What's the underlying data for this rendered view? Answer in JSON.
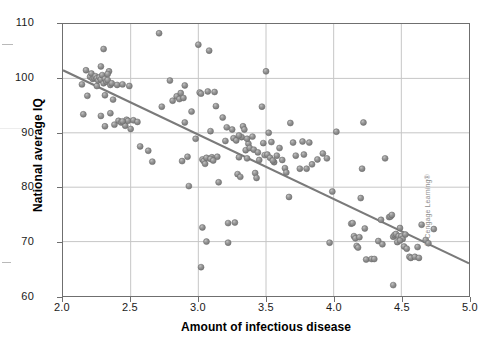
{
  "figure": {
    "credit": "© Cengage Learning®",
    "marker_color": "#8c8c8c",
    "marker_edge_color": "#6b6b6b",
    "line_color": "#7a7a7a",
    "grid_color": "#c6c6c6",
    "frame_color": "#6f6f6f",
    "background": "#ffffff"
  },
  "chart_data": {
    "type": "scatter",
    "title": "",
    "xlabel": "Amount of infectious disease",
    "ylabel": "National average IQ",
    "xlim": [
      2.0,
      5.0
    ],
    "ylim": [
      60,
      110
    ],
    "xticks": [
      2.0,
      2.5,
      3.0,
      3.5,
      4.0,
      4.5,
      5.0
    ],
    "xtick_labels": [
      "2.0",
      "2.5",
      "3.0",
      "3.5",
      "4.0",
      "4.5",
      "5.0"
    ],
    "yticks": [
      60,
      70,
      80,
      90,
      100,
      110
    ],
    "ytick_labels": [
      "60",
      "70",
      "80",
      "90",
      "100",
      "110"
    ],
    "grid": true,
    "grid_x": [
      2.5,
      3.0,
      3.5,
      4.0,
      4.5
    ],
    "grid_y": [
      70,
      80,
      90,
      100
    ],
    "legend": null,
    "marker_size_px": 6,
    "trendline": {
      "type": "linear",
      "x": [
        2.0,
        5.0
      ],
      "y": [
        101.5,
        66.0
      ],
      "slope": -11.83,
      "intercept": 125.2
    },
    "n_points": 182,
    "points": [
      [
        2.14,
        98.9
      ],
      [
        2.17,
        101.5
      ],
      [
        2.18,
        96.8
      ],
      [
        2.2,
        100.3
      ],
      [
        2.21,
        100.9
      ],
      [
        2.22,
        99.9
      ],
      [
        2.23,
        100.1
      ],
      [
        2.24,
        100.4
      ],
      [
        2.25,
        100.0
      ],
      [
        2.25,
        98.6
      ],
      [
        2.26,
        99.6
      ],
      [
        2.27,
        100.2
      ],
      [
        2.28,
        102.2
      ],
      [
        2.28,
        99.8
      ],
      [
        2.29,
        100.6
      ],
      [
        2.3,
        99.1
      ],
      [
        2.3,
        105.4
      ],
      [
        2.31,
        99.9
      ],
      [
        2.31,
        96.9
      ],
      [
        2.32,
        99.4
      ],
      [
        2.33,
        99.7
      ],
      [
        2.34,
        101.3
      ],
      [
        2.35,
        98.8
      ],
      [
        2.36,
        99.1
      ],
      [
        2.15,
        93.4
      ],
      [
        2.28,
        93.1
      ],
      [
        2.31,
        91.2
      ],
      [
        2.35,
        93.6
      ],
      [
        2.37,
        96.1
      ],
      [
        2.4,
        98.8
      ],
      [
        2.44,
        98.9
      ],
      [
        2.49,
        98.6
      ],
      [
        2.41,
        92.2
      ],
      [
        2.43,
        91.9
      ],
      [
        2.46,
        91.3
      ],
      [
        2.47,
        92.4
      ],
      [
        2.48,
        92.2
      ],
      [
        2.5,
        90.7
      ],
      [
        2.52,
        92.3
      ],
      [
        2.55,
        92.0
      ],
      [
        2.57,
        87.5
      ],
      [
        2.63,
        86.7
      ],
      [
        2.66,
        84.7
      ],
      [
        2.71,
        108.3
      ],
      [
        2.73,
        94.8
      ],
      [
        2.79,
        99.6
      ],
      [
        2.81,
        95.9
      ],
      [
        2.84,
        96.7
      ],
      [
        2.86,
        96.2
      ],
      [
        2.87,
        97.3
      ],
      [
        2.89,
        96.4
      ],
      [
        2.9,
        98.7
      ],
      [
        2.88,
        84.8
      ],
      [
        2.9,
        91.9
      ],
      [
        2.92,
        85.6
      ],
      [
        2.93,
        80.2
      ],
      [
        2.95,
        93.9
      ],
      [
        2.98,
        88.9
      ],
      [
        3.0,
        106.2
      ],
      [
        3.01,
        97.4
      ],
      [
        3.02,
        97.2
      ],
      [
        3.03,
        85.1
      ],
      [
        3.04,
        84.8
      ],
      [
        3.05,
        84.3
      ],
      [
        3.06,
        85.4
      ],
      [
        3.06,
        70.0
      ],
      [
        3.03,
        72.6
      ],
      [
        3.02,
        65.3
      ],
      [
        3.07,
        97.6
      ],
      [
        3.08,
        105.1
      ],
      [
        3.09,
        90.3
      ],
      [
        3.1,
        85.5
      ],
      [
        3.12,
        97.5
      ],
      [
        3.13,
        94.9
      ],
      [
        3.14,
        85.6
      ],
      [
        3.15,
        80.9
      ],
      [
        3.18,
        92.8
      ],
      [
        3.2,
        88.5
      ],
      [
        3.21,
        91.0
      ],
      [
        3.22,
        73.4
      ],
      [
        3.22,
        69.8
      ],
      [
        3.25,
        90.6
      ],
      [
        3.26,
        89.0
      ],
      [
        3.27,
        73.5
      ],
      [
        3.28,
        88.6
      ],
      [
        3.29,
        82.4
      ],
      [
        3.3,
        85.5
      ],
      [
        3.31,
        81.9
      ],
      [
        3.32,
        89.2
      ],
      [
        3.33,
        91.2
      ],
      [
        3.34,
        90.6
      ],
      [
        3.35,
        86.8
      ],
      [
        3.36,
        85.3
      ],
      [
        3.37,
        88.0
      ],
      [
        3.38,
        87.2
      ],
      [
        3.4,
        89.3
      ],
      [
        3.41,
        86.9
      ],
      [
        3.42,
        82.6
      ],
      [
        3.43,
        81.7
      ],
      [
        3.45,
        85.0
      ],
      [
        3.47,
        94.8
      ],
      [
        3.48,
        88.1
      ],
      [
        3.49,
        85.9
      ],
      [
        3.5,
        101.3
      ],
      [
        3.51,
        86.0
      ],
      [
        3.52,
        90.0
      ],
      [
        3.53,
        85.4
      ],
      [
        3.54,
        88.3
      ],
      [
        3.56,
        84.6
      ],
      [
        3.58,
        85.8
      ],
      [
        3.6,
        87.2
      ],
      [
        3.62,
        85.0
      ],
      [
        3.64,
        83.5
      ],
      [
        3.65,
        82.7
      ],
      [
        3.67,
        78.2
      ],
      [
        3.68,
        91.8
      ],
      [
        3.7,
        88.2
      ],
      [
        3.72,
        85.8
      ],
      [
        3.75,
        83.4
      ],
      [
        3.77,
        88.4
      ],
      [
        3.78,
        86.0
      ],
      [
        3.8,
        83.4
      ],
      [
        3.82,
        88.2
      ],
      [
        3.84,
        84.2
      ],
      [
        3.88,
        85.1
      ],
      [
        3.92,
        86.2
      ],
      [
        3.95,
        85.3
      ],
      [
        3.97,
        69.8
      ],
      [
        3.99,
        79.2
      ],
      [
        4.02,
        90.2
      ],
      [
        4.13,
        73.3
      ],
      [
        4.14,
        73.4
      ],
      [
        4.15,
        71.0
      ],
      [
        4.16,
        70.6
      ],
      [
        4.17,
        69.2
      ],
      [
        4.18,
        68.9
      ],
      [
        4.2,
        78.0
      ],
      [
        4.21,
        83.4
      ],
      [
        4.22,
        91.9
      ],
      [
        4.23,
        72.4
      ],
      [
        4.24,
        66.7
      ],
      [
        4.28,
        66.8
      ],
      [
        4.3,
        66.8
      ],
      [
        4.33,
        70.1
      ],
      [
        4.35,
        74.0
      ],
      [
        4.36,
        69.5
      ],
      [
        4.38,
        85.3
      ],
      [
        4.41,
        74.5
      ],
      [
        4.42,
        74.6
      ],
      [
        4.43,
        74.9
      ],
      [
        4.44,
        70.9
      ],
      [
        4.44,
        62.0
      ],
      [
        4.45,
        71.2
      ],
      [
        4.46,
        71.4
      ],
      [
        4.47,
        69.9
      ],
      [
        4.48,
        71.0
      ],
      [
        4.49,
        72.5
      ],
      [
        4.5,
        71.0
      ],
      [
        4.51,
        70.5
      ],
      [
        4.52,
        69.1
      ],
      [
        4.53,
        71.3
      ],
      [
        4.54,
        68.7
      ],
      [
        4.56,
        67.2
      ],
      [
        4.57,
        67.0
      ],
      [
        4.6,
        67.2
      ],
      [
        4.62,
        69.0
      ],
      [
        4.63,
        67.0
      ],
      [
        4.65,
        73.1
      ],
      [
        4.68,
        70.3
      ],
      [
        4.7,
        69.7
      ],
      [
        4.74,
        72.3
      ],
      [
        3.3,
        89.5
      ],
      [
        3.36,
        88.9
      ],
      [
        3.44,
        86.4
      ],
      [
        2.38,
        91.5
      ],
      [
        2.44,
        92.1
      ],
      [
        3.09,
        85.2
      ],
      [
        3.11,
        84.9
      ],
      [
        4.19,
        70.8
      ],
      [
        4.49,
        70.2
      ],
      [
        3.55,
        84.9
      ],
      [
        2.33,
        100.8
      ]
    ]
  }
}
